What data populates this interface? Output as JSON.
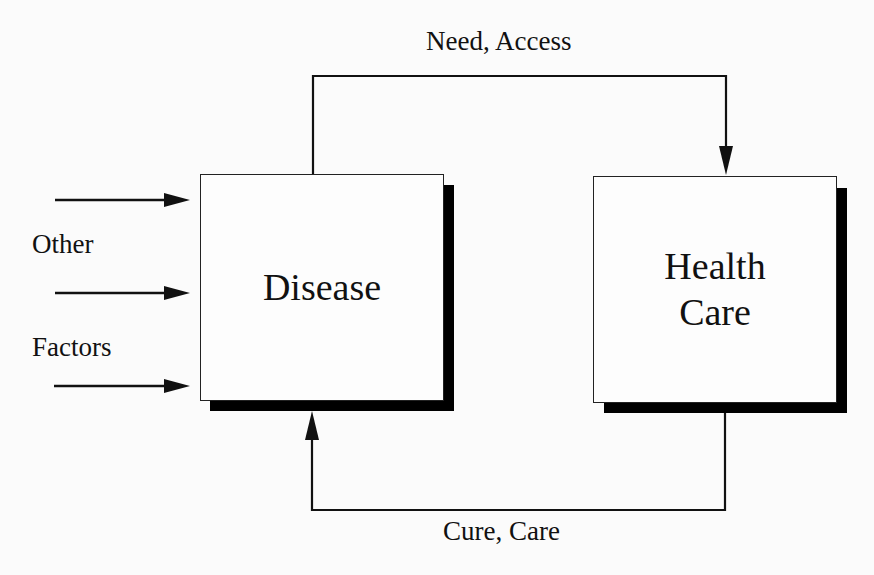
{
  "diagram": {
    "nodes": {
      "disease": {
        "label": "Disease"
      },
      "health_care": {
        "line1": "Health",
        "line2": "Care"
      }
    },
    "edges": {
      "need_access": {
        "label": "Need, Access",
        "from": "Disease",
        "to": "Health Care"
      },
      "cure_care": {
        "label": "Cure, Care",
        "from": "Health Care",
        "to": "Disease"
      }
    },
    "inputs": {
      "label_line1": "Other",
      "label_line2": "Factors",
      "arrow_count": 3,
      "target": "Disease"
    },
    "colors": {
      "line": "#111111",
      "shadow": "#000000",
      "box_fill": "#fdfdfd",
      "background": "#fbfbfb"
    }
  }
}
